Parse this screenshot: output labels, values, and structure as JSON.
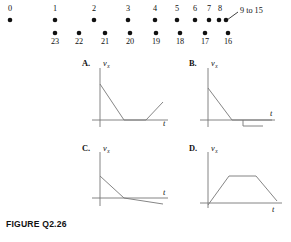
{
  "figure": {
    "caption": "FIGURE Q2.26",
    "dot_diagram": {
      "annotation": "9 to 15",
      "top_row": [
        {
          "label": "0",
          "x": 10,
          "y": 20,
          "label_x": 10,
          "label_y": 11
        },
        {
          "label": "1",
          "x": 55,
          "y": 20,
          "label_x": 55,
          "label_y": 11
        },
        {
          "label": "2",
          "x": 94,
          "y": 20,
          "label_x": 94,
          "label_y": 11
        },
        {
          "label": "3",
          "x": 128,
          "y": 20,
          "label_x": 128,
          "label_y": 11
        },
        {
          "label": "4",
          "x": 155,
          "y": 20,
          "label_x": 155,
          "label_y": 11
        },
        {
          "label": "5",
          "x": 177,
          "y": 20,
          "label_x": 177,
          "label_y": 11
        },
        {
          "label": "6",
          "x": 195,
          "y": 20,
          "label_x": 195,
          "label_y": 11
        },
        {
          "label": "7",
          "x": 209,
          "y": 20,
          "label_x": 209,
          "label_y": 11
        },
        {
          "label": "8",
          "x": 219,
          "y": 20,
          "label_x": 220,
          "label_y": 11
        },
        {
          "label": "",
          "x": 226,
          "y": 20,
          "label_x": 226,
          "label_y": 11
        }
      ],
      "bottom_row": [
        {
          "label": "23",
          "x": 55,
          "y": 33,
          "label_x": 55,
          "label_y": 44
        },
        {
          "label": "22",
          "x": 79,
          "y": 33,
          "label_x": 79,
          "label_y": 44
        },
        {
          "label": "21",
          "x": 105,
          "y": 33,
          "label_x": 105,
          "label_y": 44
        },
        {
          "label": "20",
          "x": 130,
          "y": 33,
          "label_x": 130,
          "label_y": 44
        },
        {
          "label": "19",
          "x": 156,
          "y": 33,
          "label_x": 156,
          "label_y": 44
        },
        {
          "label": "18",
          "x": 180,
          "y": 33,
          "label_x": 180,
          "label_y": 44
        },
        {
          "label": "17",
          "x": 205,
          "y": 33,
          "label_x": 205,
          "label_y": 44
        },
        {
          "label": "16",
          "x": 228,
          "y": 33,
          "label_x": 228,
          "label_y": 44
        }
      ]
    },
    "panels": [
      {
        "id": "A",
        "letter": "A.",
        "y_axis_label": "v",
        "y_axis_subscript": "x",
        "x_axis_label": "t",
        "origin_x": 100,
        "origin_y": 120,
        "x_axis_end": 168,
        "y_axis_top": 68,
        "y_axis_bottom": 127,
        "curve": "100,84 124,120 146,120 163,102",
        "letter_x": 82,
        "letter_y": 66,
        "ylabel_x": 103,
        "ylabel_y": 66,
        "xlabel_x": 163,
        "xlabel_y": 126
      },
      {
        "id": "B",
        "letter": "B.",
        "y_axis_label": "v",
        "y_axis_subscript": "x",
        "x_axis_label": "t",
        "origin_x": 208,
        "origin_y": 120,
        "x_axis_end": 275,
        "y_axis_top": 68,
        "y_axis_bottom": 127,
        "curve": "208,88 232,120 272,120",
        "step": "243,120 243,126 263,126",
        "letter_x": 189,
        "letter_y": 66,
        "ylabel_x": 211,
        "ylabel_y": 66,
        "xlabel_x": 270,
        "xlabel_y": 116
      },
      {
        "id": "C",
        "letter": "C.",
        "y_axis_label": "v",
        "y_axis_subscript": "x",
        "x_axis_label": "t",
        "origin_x": 100,
        "origin_y": 198,
        "x_axis_end": 168,
        "y_axis_top": 152,
        "y_axis_bottom": 206,
        "curve": "100,176 124,198 163,204",
        "letter_x": 82,
        "letter_y": 151,
        "ylabel_x": 103,
        "ylabel_y": 151,
        "xlabel_x": 163,
        "xlabel_y": 195
      },
      {
        "id": "D",
        "letter": "D.",
        "y_axis_label": "v",
        "y_axis_subscript": "x",
        "x_axis_label": "t",
        "origin_x": 208,
        "origin_y": 203,
        "x_axis_end": 282,
        "y_axis_top": 152,
        "y_axis_bottom": 208,
        "curve": "208,205 229,176 256,176 277,201",
        "letter_x": 189,
        "letter_y": 151,
        "ylabel_x": 211,
        "ylabel_y": 151,
        "xlabel_x": 272,
        "xlabel_y": 212
      }
    ]
  }
}
